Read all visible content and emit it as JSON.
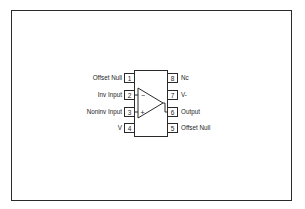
{
  "diagram": {
    "type": "8-pin op-amp pinout (DIP)",
    "stroke_color": "#2a2a2a",
    "background": "#ffffff",
    "left_pins": [
      {
        "number": "1",
        "label": "Offset Null"
      },
      {
        "number": "2",
        "label": "Inv Input"
      },
      {
        "number": "3",
        "label": "Noninv Input"
      },
      {
        "number": "4",
        "label": "V"
      }
    ],
    "right_pins": [
      {
        "number": "8",
        "label": "Nc"
      },
      {
        "number": "7",
        "label": "V-"
      },
      {
        "number": "6",
        "label": "Output"
      },
      {
        "number": "5",
        "label": "Offset Null"
      }
    ],
    "opamp": {
      "inverting_sign": "−",
      "noninverting_sign": "+"
    }
  }
}
